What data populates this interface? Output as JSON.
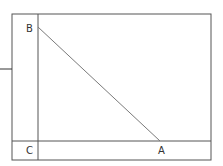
{
  "diagram": {
    "points": {
      "A": {
        "label": "A",
        "x": 160,
        "y": 141
      },
      "B": {
        "label": "B",
        "x": 38,
        "y": 28
      },
      "C": {
        "label": "C",
        "x": 38,
        "y": 141
      }
    },
    "line_color": "#7a7a7a",
    "frame_color": "#555555"
  }
}
